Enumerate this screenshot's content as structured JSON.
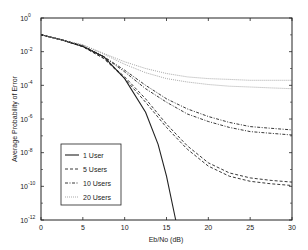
{
  "chart_data": {
    "type": "line",
    "title": "",
    "xlabel": "Eb/No (dB)",
    "ylabel": "Average Probability of Error",
    "xlim": [
      0,
      30
    ],
    "ylim_log10": [
      -12,
      0
    ],
    "yscale": "log",
    "x_ticks": [
      0,
      5,
      10,
      15,
      20,
      25,
      30
    ],
    "y_ticks": [
      {
        "exp": "0"
      },
      {
        "exp": "-2"
      },
      {
        "exp": "-4"
      },
      {
        "exp": "-6"
      },
      {
        "exp": "-8"
      },
      {
        "exp": "-10"
      },
      {
        "exp": "-12"
      }
    ],
    "grid": false,
    "legend_position": "lower left",
    "legend": [
      "1 User",
      "5 Users",
      "10 Users",
      "20 Users"
    ],
    "series": [
      {
        "name": "1 User",
        "style": "solid",
        "x": [
          0,
          2.5,
          5,
          7.5,
          10,
          12.5,
          14,
          15,
          16.1
        ],
        "log10_y": [
          -1.0,
          -1.3,
          -1.7,
          -2.3,
          -3.6,
          -5.6,
          -7.5,
          -9.4,
          -12.0
        ]
      },
      {
        "name": "5 Users",
        "style": "dashed",
        "x": [
          0,
          2.5,
          5,
          7.5,
          10,
          12.5,
          15,
          17.5,
          20,
          22.5,
          25,
          27.5,
          30
        ],
        "log10_y": [
          -1.0,
          -1.3,
          -1.7,
          -2.4,
          -3.5,
          -4.8,
          -6.3,
          -7.6,
          -8.6,
          -9.2,
          -9.5,
          -9.65,
          -9.75
        ]
      },
      {
        "name": "5 Users",
        "style": "dashed",
        "x": [
          0,
          2.5,
          5,
          7.5,
          10,
          12.5,
          15,
          17.5,
          20,
          22.5,
          25,
          27.5,
          30
        ],
        "log10_y": [
          -1.0,
          -1.3,
          -1.7,
          -2.4,
          -3.6,
          -5.0,
          -6.5,
          -7.8,
          -8.8,
          -9.4,
          -9.7,
          -9.85,
          -9.95
        ]
      },
      {
        "name": "10 Users",
        "style": "dashdot",
        "x": [
          0,
          2.5,
          5,
          7.5,
          10,
          12.5,
          15,
          17.5,
          20,
          22.5,
          25,
          27.5,
          30
        ],
        "log10_y": [
          -1.0,
          -1.3,
          -1.65,
          -2.3,
          -3.1,
          -4.0,
          -4.8,
          -5.4,
          -5.85,
          -6.2,
          -6.45,
          -6.55,
          -6.65
        ]
      },
      {
        "name": "10 Users",
        "style": "dashdot",
        "x": [
          0,
          2.5,
          5,
          7.5,
          10,
          12.5,
          15,
          17.5,
          20,
          22.5,
          25,
          27.5,
          30
        ],
        "log10_y": [
          -1.0,
          -1.3,
          -1.65,
          -2.3,
          -3.2,
          -4.2,
          -5.0,
          -5.7,
          -6.15,
          -6.5,
          -6.75,
          -6.85,
          -6.95
        ]
      },
      {
        "name": "20 Users",
        "style": "dotted",
        "x": [
          0,
          2.5,
          5,
          7.5,
          10,
          12.5,
          15,
          17.5,
          20,
          22.5,
          25,
          27.5,
          30
        ],
        "log10_y": [
          -1.0,
          -1.3,
          -1.6,
          -2.1,
          -2.6,
          -3.0,
          -3.3,
          -3.5,
          -3.6,
          -3.65,
          -3.7,
          -3.7,
          -3.7
        ]
      },
      {
        "name": "20 Users",
        "style": "dotted",
        "x": [
          0,
          2.5,
          5,
          7.5,
          10,
          12.5,
          15,
          17.5,
          20,
          22.5,
          25,
          27.5,
          30
        ],
        "log10_y": [
          -1.0,
          -1.3,
          -1.6,
          -2.15,
          -2.75,
          -3.25,
          -3.6,
          -3.8,
          -3.95,
          -4.05,
          -4.1,
          -4.15,
          -4.2
        ]
      }
    ]
  },
  "colors": {
    "axis": "#222222",
    "line": "#222222",
    "dotted_line": "#888888",
    "background": "#ffffff"
  }
}
